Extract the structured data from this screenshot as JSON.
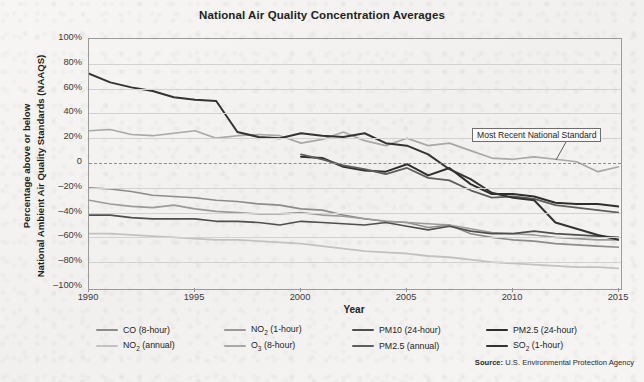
{
  "title": "National Air Quality Concentration Averages",
  "axis": {
    "x_label": "Year",
    "y_label_line1": "Percentage above or below",
    "y_label_line2": "National Ambient Air Quality Standards (NAAQS)",
    "y_ticks": [
      "100%",
      "80%",
      "60%",
      "40%",
      "20%",
      "0",
      "–20%",
      "–40%",
      "–60%",
      "–80%",
      "–100%"
    ],
    "x_ticks": [
      "1990",
      "1995",
      "2000",
      "2005",
      "2010",
      "2015"
    ]
  },
  "annotation": {
    "text": "Most Recent National Standard"
  },
  "source": {
    "prefix": "Source:",
    "text": "U.S. Environmental Protection Agency"
  },
  "legend": [
    {
      "label": "CO (8-hour)",
      "base": "CO",
      "sub": "",
      "suffix": " (8-hour)",
      "color": "#8c8c8c"
    },
    {
      "label": "NO2 (1-hour)",
      "base": "NO",
      "sub": "2",
      "suffix": " (1-hour)",
      "color": "#9a9a9a"
    },
    {
      "label": "PM10 (24-hour)",
      "base": "PM10",
      "sub": "",
      "suffix": " (24-hour)",
      "color": "#4f4f4f"
    },
    {
      "label": "PM2.5 (24-hour)",
      "base": "PM2.5",
      "sub": "",
      "suffix": " (24-hour)",
      "color": "#2e2e2e"
    },
    {
      "label": "NO2 (annual)",
      "base": "NO",
      "sub": "2",
      "suffix": " (annual)",
      "color": "#c2c2c2"
    },
    {
      "label": "O3 (8-hour)",
      "base": "O",
      "sub": "3",
      "suffix": " (8-hour)",
      "color": "#a8a8a8"
    },
    {
      "label": "PM2.5 (annual)",
      "base": "PM2.5",
      "sub": "",
      "suffix": " (annual)",
      "color": "#5e5e5e"
    },
    {
      "label": "SO2 (1-hour)",
      "base": "SO",
      "sub": "2",
      "suffix": " (1-hour)",
      "color": "#333333"
    }
  ],
  "chart_data": {
    "type": "line",
    "title": "National Air Quality Concentration Averages",
    "xlabel": "Year",
    "ylabel": "Percentage above or below National Ambient Air Quality Standards (NAAQS)",
    "xlim": [
      1990,
      2015
    ],
    "ylim": [
      -100,
      100
    ],
    "grid": true,
    "legend_position": "bottom",
    "reference_line": {
      "value": 0,
      "style": "dashed",
      "label": "Most Recent National Standard"
    },
    "x": [
      1990,
      1991,
      1992,
      1993,
      1994,
      1995,
      1996,
      1997,
      1998,
      1999,
      2000,
      2001,
      2002,
      2003,
      2004,
      2005,
      2006,
      2007,
      2008,
      2009,
      2010,
      2011,
      2012,
      2013,
      2014,
      2015
    ],
    "series": [
      {
        "name": "CO (8-hour)",
        "color": "#8c8c8c",
        "values": [
          -20,
          -21,
          -23,
          -26,
          -27,
          -28,
          -30,
          -31,
          -33,
          -34,
          -37,
          -38,
          -42,
          -45,
          -47,
          -48,
          -52,
          -50,
          -57,
          -60,
          -62,
          -63,
          -65,
          -66,
          -67,
          -68
        ]
      },
      {
        "name": "NO2 (1-hour)",
        "color": "#9a9a9a",
        "values": [
          -30,
          -33,
          -35,
          -36,
          -34,
          -37,
          -39,
          -40,
          -41,
          -41,
          -40,
          -42,
          -43,
          -45,
          -47,
          -48,
          -49,
          -50,
          -53,
          -56,
          -57,
          -58,
          -60,
          -61,
          -62,
          -62
        ]
      },
      {
        "name": "PM10 (24-hour)",
        "color": "#4f4f4f",
        "values": [
          -42,
          -42,
          -44,
          -45,
          -45,
          -45,
          -47,
          -47,
          -48,
          -50,
          -47,
          -48,
          -49,
          -50,
          -48,
          -51,
          -54,
          -51,
          -55,
          -57,
          -57,
          -55,
          -57,
          -58,
          -59,
          -60
        ]
      },
      {
        "name": "PM2.5 (24-hour)",
        "color": "#2e2e2e",
        "values": [
          null,
          null,
          null,
          null,
          null,
          null,
          null,
          null,
          null,
          null,
          5,
          4,
          -3,
          -6,
          -7,
          -1,
          -10,
          -4,
          -17,
          -25,
          -25,
          -27,
          -32,
          -33,
          -33,
          -35
        ]
      },
      {
        "name": "NO2 (annual)",
        "color": "#c2c2c2",
        "values": [
          -57,
          -57,
          -58,
          -59,
          -60,
          -61,
          -62,
          -62,
          -63,
          -64,
          -65,
          -67,
          -69,
          -71,
          -72,
          -73,
          -75,
          -76,
          -78,
          -80,
          -81,
          -82,
          -83,
          -84,
          -84,
          -85
        ]
      },
      {
        "name": "O3 (8-hour)",
        "color": "#a8a8a8",
        "values": [
          26,
          27,
          23,
          22,
          24,
          26,
          20,
          22,
          23,
          22,
          16,
          19,
          25,
          18,
          14,
          20,
          14,
          16,
          10,
          4,
          3,
          5,
          3,
          1,
          -7,
          -3
        ]
      },
      {
        "name": "PM2.5 (annual)",
        "color": "#5e5e5e",
        "values": [
          null,
          null,
          null,
          null,
          null,
          null,
          null,
          null,
          null,
          null,
          7,
          3,
          -2,
          -5,
          -9,
          -4,
          -12,
          -14,
          -22,
          -28,
          -27,
          -29,
          -34,
          -36,
          -38,
          -40
        ]
      },
      {
        "name": "SO2 (1-hour)",
        "color": "#333333",
        "values": [
          72,
          65,
          61,
          58,
          53,
          51,
          50,
          25,
          21,
          20,
          24,
          22,
          21,
          24,
          16,
          14,
          7,
          -5,
          -13,
          -24,
          -28,
          -30,
          -48,
          -53,
          -58,
          -62
        ]
      }
    ]
  }
}
